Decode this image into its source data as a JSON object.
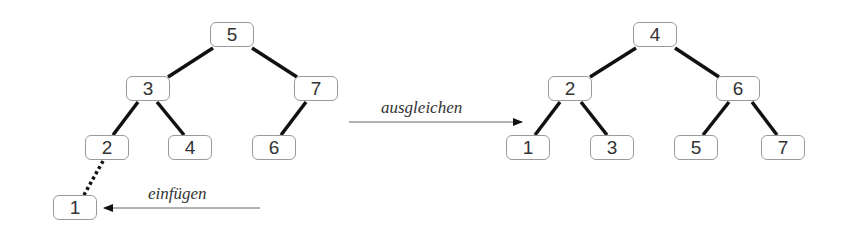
{
  "diagram": {
    "type": "avl-tree-rebalance",
    "left_tree": {
      "nodes": [
        {
          "id": "L5",
          "value": "5",
          "x": 210,
          "y": 22
        },
        {
          "id": "L3",
          "value": "3",
          "x": 126,
          "y": 76
        },
        {
          "id": "L7",
          "value": "7",
          "x": 294,
          "y": 76
        },
        {
          "id": "L2",
          "value": "2",
          "x": 85,
          "y": 135
        },
        {
          "id": "L4",
          "value": "4",
          "x": 168,
          "y": 135
        },
        {
          "id": "L6",
          "value": "6",
          "x": 252,
          "y": 135
        },
        {
          "id": "L1",
          "value": "1",
          "x": 53,
          "y": 195
        }
      ],
      "edges": [
        {
          "from": "5",
          "to": "3",
          "style": "solid"
        },
        {
          "from": "5",
          "to": "7",
          "style": "solid"
        },
        {
          "from": "3",
          "to": "2",
          "style": "solid"
        },
        {
          "from": "3",
          "to": "4",
          "style": "solid"
        },
        {
          "from": "7",
          "to": "6",
          "style": "solid"
        },
        {
          "from": "2",
          "to": "1",
          "style": "dotted"
        }
      ]
    },
    "right_tree": {
      "nodes": [
        {
          "id": "R4",
          "value": "4",
          "x": 633,
          "y": 22
        },
        {
          "id": "R2",
          "value": "2",
          "x": 548,
          "y": 76
        },
        {
          "id": "R6",
          "value": "6",
          "x": 716,
          "y": 76
        },
        {
          "id": "R1",
          "value": "1",
          "x": 506,
          "y": 135
        },
        {
          "id": "R3",
          "value": "3",
          "x": 590,
          "y": 135
        },
        {
          "id": "R5",
          "value": "5",
          "x": 674,
          "y": 135
        },
        {
          "id": "R7",
          "value": "7",
          "x": 761,
          "y": 135
        }
      ],
      "edges": [
        {
          "from": "4",
          "to": "2",
          "style": "solid"
        },
        {
          "from": "4",
          "to": "6",
          "style": "solid"
        },
        {
          "from": "2",
          "to": "1",
          "style": "solid"
        },
        {
          "from": "2",
          "to": "3",
          "style": "solid"
        },
        {
          "from": "6",
          "to": "5",
          "style": "solid"
        },
        {
          "from": "6",
          "to": "7",
          "style": "solid"
        }
      ]
    },
    "labels": {
      "insert": "einfügen",
      "rebalance": "ausgleichen"
    },
    "colors": {
      "edge": "#111111",
      "node_border": "#9a9a9a",
      "text": "#333333",
      "arrow": "#555555"
    }
  }
}
